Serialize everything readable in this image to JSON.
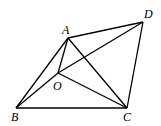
{
  "labels": {
    "A": "A",
    "B": "B",
    "C": "C",
    "D": "D",
    "O": "O"
  },
  "points": {
    "A": [
      68,
      38
    ],
    "B": [
      16,
      108
    ],
    "C": [
      127,
      108
    ],
    "D": [
      143,
      22
    ],
    "O": [
      58,
      73
    ]
  },
  "segments": [
    [
      "A",
      "D"
    ],
    [
      "D",
      "C"
    ],
    [
      "B",
      "C"
    ],
    [
      "A",
      "B"
    ],
    [
      "A",
      "C"
    ],
    [
      "A",
      "O"
    ],
    [
      "O",
      "C"
    ],
    [
      "O",
      "D"
    ],
    [
      "B",
      "D"
    ]
  ]
}
